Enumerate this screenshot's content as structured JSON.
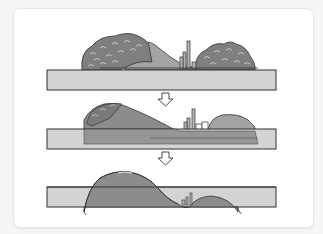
{
  "diagram": {
    "stages": [
      {
        "id": 1,
        "name": "stage-original",
        "state": "landform fully above surface line"
      },
      {
        "id": 2,
        "name": "stage-sinking",
        "state": "landform partly submerged, trees lost"
      },
      {
        "id": 3,
        "name": "stage-submerged",
        "state": "landform mostly below surface line"
      }
    ],
    "arrows": [
      {
        "from": 1,
        "to": 2,
        "direction": "down"
      },
      {
        "from": 2,
        "to": 3,
        "direction": "down"
      }
    ],
    "colors": {
      "background": "#f5f5f5",
      "card": "#ffffff",
      "layer_fill": "#d3d3d3",
      "hill_fill": "#8c8c8c",
      "tree_fill": "#7a7a7a",
      "outline": "#333333",
      "slope_fill": "#a3a3a3"
    }
  }
}
